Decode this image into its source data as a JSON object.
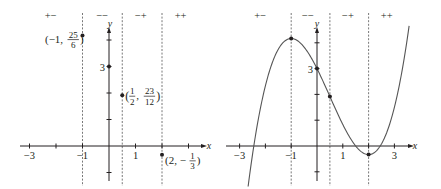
{
  "chart_data": [
    {
      "type": "scatter",
      "panel": "left",
      "title": "",
      "xlabel": "x",
      "ylabel": "y",
      "xlim": [
        -3.5,
        3.6
      ],
      "ylim": [
        -1.3,
        4.6
      ],
      "grid": false,
      "x_ticks": [
        -3,
        -2,
        -1,
        1,
        2,
        3
      ],
      "x_tick_labels": [
        {
          "x": -3,
          "label": "−3"
        },
        {
          "x": -1,
          "label": "−1"
        },
        {
          "x": 1,
          "label": "1"
        }
      ],
      "y_ticks": [
        -1,
        1,
        2,
        3,
        4
      ],
      "y_tick_labels": [
        {
          "y": 3,
          "label": "3"
        }
      ],
      "dashed_verticals": [
        -1,
        0.5,
        2
      ],
      "sign_labels": [
        {
          "x": -2.2,
          "label": "+−"
        },
        {
          "x": -0.25,
          "label": "−−"
        },
        {
          "x": 1.2,
          "label": "−+"
        },
        {
          "x": 2.7,
          "label": "++"
        }
      ],
      "points": [
        {
          "x": -1,
          "y": 4.1667,
          "label_main": "(−1, ",
          "label_num": "25",
          "label_den": "6",
          "label_end": ")",
          "label_side": "left"
        },
        {
          "x": 0,
          "y": 3,
          "label": "3"
        },
        {
          "x": 0.5,
          "y": 1.9167,
          "label_main": "(",
          "label_frac1_num": "1",
          "label_frac1_den": "2",
          "label_sep": ", ",
          "label_num": "23",
          "label_den": "12",
          "label_end": ")",
          "label_side": "right"
        },
        {
          "x": 2,
          "y": -0.3333,
          "label_main": "(2, −",
          "label_num": "1",
          "label_den": "3",
          "label_end": ")",
          "label_side": "right"
        }
      ]
    },
    {
      "type": "line",
      "panel": "right",
      "title": "",
      "xlabel": "x",
      "ylabel": "y",
      "function": "x^3/3 - x^2/2 - 2x + 3",
      "xlim": [
        -3.5,
        3.6
      ],
      "ylim": [
        -1.6,
        4.7
      ],
      "grid": false,
      "x_ticks": [
        -3,
        -2,
        -1,
        1,
        2,
        3
      ],
      "x_tick_labels": [
        {
          "x": -3,
          "label": "−3"
        },
        {
          "x": -1,
          "label": "−1"
        },
        {
          "x": 1,
          "label": "1"
        },
        {
          "x": 3,
          "label": "3"
        }
      ],
      "y_ticks": [
        -1,
        1,
        2,
        3,
        4
      ],
      "y_tick_labels": [
        {
          "y": 3,
          "label": "3"
        }
      ],
      "dashed_verticals": [
        -1,
        0.5,
        2
      ],
      "sign_labels": [
        {
          "x": -2.2,
          "label": "+−"
        },
        {
          "x": -0.35,
          "label": "−−"
        },
        {
          "x": 1.2,
          "label": "−+"
        },
        {
          "x": 2.7,
          "label": "++"
        }
      ],
      "curve_domain": [
        -2.67,
        3.57
      ],
      "points": [
        {
          "x": -1,
          "y": 4.1667
        },
        {
          "x": 0,
          "y": 3
        },
        {
          "x": 0.5,
          "y": 1.9167
        },
        {
          "x": 2,
          "y": -0.3333
        }
      ]
    }
  ],
  "layout": {
    "panels": [
      {
        "ox": 109,
        "oy": 146,
        "unit": 26.5,
        "axis_x_from": 20,
        "axis_x_to": 203,
        "axis_y_from": 31,
        "axis_y_to": 181,
        "dash_top": 13,
        "dash_bottom": 186,
        "xlabel_pos": [
          209,
          149
        ],
        "ylabel_pos": [
          110,
          27
        ],
        "sign_y": 19
      },
      {
        "ox": 317,
        "oy": 146,
        "unit": 25.8,
        "axis_x_from": 226,
        "axis_x_to": 410,
        "axis_y_from": 31,
        "axis_y_to": 181,
        "dash_top": 13,
        "dash_bottom": 186,
        "xlabel_pos": [
          415,
          149
        ],
        "ylabel_pos": [
          317,
          27
        ],
        "sign_y": 19
      }
    ]
  }
}
